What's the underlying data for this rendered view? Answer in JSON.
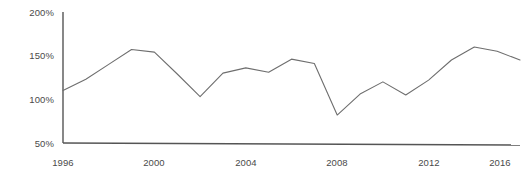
{
  "chart_data": {
    "type": "line",
    "title": "",
    "subtitle": "",
    "xlabel": "",
    "ylabel": "",
    "xlim": [
      1996,
      2016
    ],
    "ylim": [
      50,
      200
    ],
    "grid": false,
    "legend": null,
    "y_tick_labels": [
      "200%",
      "150%",
      "100%",
      "50%"
    ],
    "y_ticks": [
      200,
      150,
      100,
      50
    ],
    "x_tick_labels": [
      "1996",
      "2000",
      "2004",
      "2008",
      "2012",
      "2016"
    ],
    "x_ticks": [
      1996,
      2000,
      2004,
      2008,
      2012,
      2016
    ],
    "series": [
      {
        "name": "",
        "color": "#6e6e6e",
        "x": [
          1996,
          1997,
          1998,
          1999,
          2000,
          2001,
          2002,
          2003,
          2004,
          2005,
          2006,
          2007,
          2008,
          2009,
          2010,
          2011,
          2012,
          2013,
          2014,
          2015,
          2016
        ],
        "values": [
          110,
          123,
          140,
          157,
          154,
          129,
          103,
          130,
          136,
          131,
          146,
          141,
          82,
          106,
          120,
          105,
          122,
          145,
          160,
          155,
          145
        ]
      }
    ]
  },
  "axis": {
    "line_color": "#555555",
    "tick_text_color": "#4a4a4a"
  }
}
